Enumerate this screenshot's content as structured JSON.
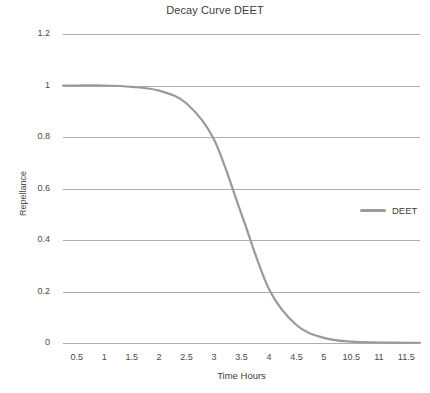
{
  "chart_data": {
    "type": "line",
    "title": "Decay Curve DEET",
    "xlabel": "Time Hours",
    "ylabel": "Repellance",
    "grid": true,
    "legend_position": "right-middle",
    "ylim": [
      0,
      1.2
    ],
    "y_ticks": [
      "0",
      "0.2",
      "0.4",
      "0.6",
      "0.8",
      "1",
      "1.2"
    ],
    "y_tick_values": [
      0,
      0.2,
      0.4,
      0.6,
      0.8,
      1,
      1.2
    ],
    "categories": [
      "0.5",
      "1",
      "1.5",
      "2",
      "2.5",
      "3",
      "3.5",
      "4",
      "4.5",
      "5",
      "10.5",
      "11",
      "11.5"
    ],
    "series": [
      {
        "name": "DEET",
        "color": "#9a9a9a",
        "values": [
          1.0,
          1.0,
          0.995,
          0.98,
          0.93,
          0.79,
          0.5,
          0.21,
          0.07,
          0.02,
          0.005,
          0.002,
          0.001
        ]
      }
    ],
    "curve_note": "Logistic decay, midpoint near 3.25 hours",
    "colors": {
      "gridline": "#aeaeae",
      "text": "#3d3d3d",
      "series_deet": "#9a9a9a",
      "background": "#ffffff"
    }
  },
  "legend": {
    "items": [
      {
        "label": "DEET"
      }
    ]
  }
}
